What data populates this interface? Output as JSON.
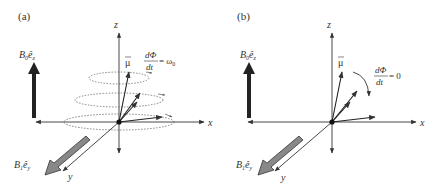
{
  "panels": [
    {
      "id": "a",
      "label": "(a)",
      "axes": {
        "z": "z",
        "x": "x",
        "y": "y"
      },
      "static_field": {
        "symbol": "B",
        "subscript": "0",
        "unit_vector": "ê",
        "unit_sub": "z"
      },
      "rf_field": {
        "symbol": "B",
        "subscript": "1",
        "unit_vector": "ê",
        "unit_sub": "y"
      },
      "moment": {
        "symbol": "μ",
        "arrow": "→"
      },
      "equation": {
        "numerator": "dΦ",
        "denominator": "dt",
        "rhs": "= ω",
        "rhs_sub": "0"
      },
      "precession_circles": 3
    },
    {
      "id": "b",
      "label": "(b)",
      "axes": {
        "z": "z",
        "x": "x",
        "y": "y"
      },
      "static_field": {
        "symbol": "B",
        "subscript": "0",
        "unit_vector": "ê",
        "unit_sub": "z"
      },
      "rf_field": {
        "symbol": "B",
        "subscript": "1",
        "unit_vector": "ê",
        "unit_sub": "y"
      },
      "moment": {
        "symbol": "μ",
        "arrow": "→"
      },
      "equation": {
        "numerator": "dΦ",
        "denominator": "dt",
        "rhs": "= 0",
        "rhs_sub": ""
      },
      "precession_circles": 0
    }
  ],
  "colors": {
    "axis": "#333333",
    "field_arrow": "#222222",
    "rf_arrow_fill": "#888888",
    "dotted": "#555555"
  }
}
